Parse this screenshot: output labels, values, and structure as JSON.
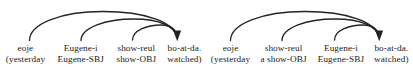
{
  "figure": {
    "type": "dependency-arc-diagram",
    "stroke_color": "#232323",
    "background_color": "#ffffff"
  },
  "groups": [
    {
      "id": "group-a",
      "name": "diagram-variant-a",
      "columns": [
        {
          "surface": "eoje",
          "gloss": "(yesterday"
        },
        {
          "surface": "Eugene-i",
          "gloss": "Eugene-SBJ"
        },
        {
          "surface": "show-reul",
          "gloss": "show-OBJ"
        },
        {
          "surface": "bo-at-da.",
          "gloss": "watched)"
        }
      ],
      "arcs": [
        {
          "from_column": 0,
          "to_column": 3,
          "depth": 1
        },
        {
          "from_column": 1,
          "to_column": 3,
          "depth": 2
        },
        {
          "from_column": 2,
          "to_column": 3,
          "depth": 3
        }
      ],
      "arrow_target": "bo-at-da."
    },
    {
      "id": "group-b",
      "name": "diagram-variant-b",
      "columns": [
        {
          "surface": "eoje",
          "gloss": "(yesterday"
        },
        {
          "surface": "show-reul",
          "gloss": "a show-OBJ"
        },
        {
          "surface": "Eugene-i",
          "gloss": "Eugene-SBJ"
        },
        {
          "surface": "bo-at-da.",
          "gloss": "watched)"
        }
      ],
      "arcs": [
        {
          "from_column": 0,
          "to_column": 3,
          "depth": 1
        },
        {
          "from_column": 1,
          "to_column": 3,
          "depth": 2
        },
        {
          "from_column": 2,
          "to_column": 3,
          "depth": 3
        }
      ],
      "arrow_target": "bo-at-da."
    }
  ]
}
